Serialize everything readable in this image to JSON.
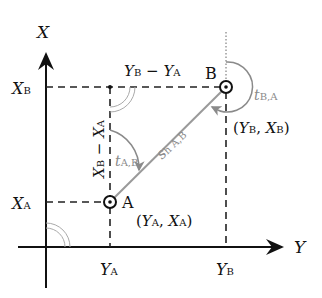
{
  "diagram": {
    "axes": {
      "vertical_label": "X",
      "horizontal_label": "Y"
    },
    "ticks": {
      "xa": {
        "main": "X",
        "sub": "A"
      },
      "xb": {
        "main": "X",
        "sub": "B"
      },
      "ya": {
        "main": "Y",
        "sub": "A"
      },
      "yb": {
        "main": "Y",
        "sub": "B"
      }
    },
    "points": {
      "a": {
        "name": "A",
        "coord_open": "(",
        "y": "Y",
        "y_sub": "A",
        "sep": ", ",
        "x": "X",
        "x_sub": "A",
        "coord_close": ")"
      },
      "b": {
        "name": "B",
        "coord_open": "(",
        "y": "Y",
        "y_sub": "B",
        "sep": ", ",
        "x": "X",
        "x_sub": "B",
        "coord_close": ")"
      }
    },
    "differences": {
      "dy": {
        "a": "Y",
        "a_sub": "B",
        "op": " − ",
        "b": "Y",
        "b_sub": "A"
      },
      "dx": {
        "a": "X",
        "a_sub": "B",
        "op": " − ",
        "b": "X",
        "b_sub": "A"
      }
    },
    "distance": {
      "main": "s",
      "sub": "h A,B"
    },
    "bearings": {
      "ab": {
        "main": "t",
        "sub": "A,B"
      },
      "ba": {
        "main": "t",
        "sub": "B,A"
      }
    },
    "colors": {
      "axis": "#111111",
      "dashed": "#222222",
      "line_ab": "#9a9a9a",
      "bearing_arc": "#8a8a8a",
      "right_angle_arc": "#aaaaaa"
    }
  }
}
